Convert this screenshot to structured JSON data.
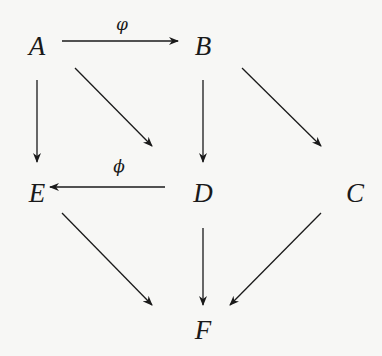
{
  "diagram": {
    "type": "commutative-diagram",
    "nodes": [
      {
        "id": "A",
        "label": "A",
        "x": 37,
        "y": 45
      },
      {
        "id": "B",
        "label": "B",
        "x": 203,
        "y": 45
      },
      {
        "id": "E",
        "label": "E",
        "x": 37,
        "y": 192
      },
      {
        "id": "D",
        "label": "D",
        "x": 203,
        "y": 192
      },
      {
        "id": "C",
        "label": "C",
        "x": 355,
        "y": 192
      },
      {
        "id": "F",
        "label": "F",
        "x": 203,
        "y": 330
      }
    ],
    "edges": [
      {
        "from": "A",
        "to": "B",
        "label": "φ"
      },
      {
        "from": "A",
        "to": "E",
        "label": ""
      },
      {
        "from": "A",
        "to": "D",
        "label": ""
      },
      {
        "from": "B",
        "to": "D",
        "label": ""
      },
      {
        "from": "B",
        "to": "C",
        "label": ""
      },
      {
        "from": "D",
        "to": "E",
        "label": "ϕ"
      },
      {
        "from": "E",
        "to": "F",
        "label": ""
      },
      {
        "from": "D",
        "to": "F",
        "label": ""
      },
      {
        "from": "C",
        "to": "F",
        "label": ""
      }
    ],
    "edge_labels": {
      "a_to_b": "φ",
      "d_to_e": "ϕ"
    },
    "colors": {
      "background": "#f7f7f5",
      "ink": "#1a1a1a"
    }
  }
}
